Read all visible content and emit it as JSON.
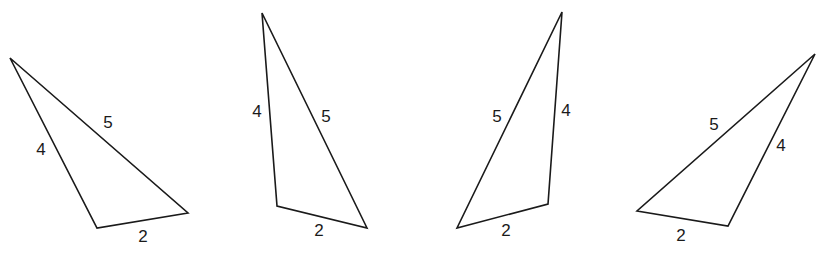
{
  "diagram": {
    "stroke_color": "#1a1a1a",
    "background": "#ffffff",
    "triangles": [
      {
        "id": "triangle-1",
        "points": "10,58 97,228 188,213",
        "labels": [
          {
            "text": "5",
            "x": 108,
            "y": 124
          },
          {
            "text": "4",
            "x": 41,
            "y": 151
          },
          {
            "text": "2",
            "x": 143,
            "y": 238
          }
        ]
      },
      {
        "id": "triangle-2",
        "points": "262,13 277,206 367,228",
        "labels": [
          {
            "text": "4",
            "x": 257,
            "y": 113
          },
          {
            "text": "5",
            "x": 326,
            "y": 118
          },
          {
            "text": "2",
            "x": 319,
            "y": 232
          }
        ]
      },
      {
        "id": "triangle-3",
        "points": "562,12 548,204 457,228",
        "labels": [
          {
            "text": "5",
            "x": 497,
            "y": 118
          },
          {
            "text": "4",
            "x": 566,
            "y": 112
          },
          {
            "text": "2",
            "x": 506,
            "y": 232
          }
        ]
      },
      {
        "id": "triangle-4",
        "points": "815,54 728,226 637,211",
        "labels": [
          {
            "text": "5",
            "x": 714,
            "y": 126
          },
          {
            "text": "4",
            "x": 781,
            "y": 147
          },
          {
            "text": "2",
            "x": 681,
            "y": 237
          }
        ]
      }
    ]
  }
}
